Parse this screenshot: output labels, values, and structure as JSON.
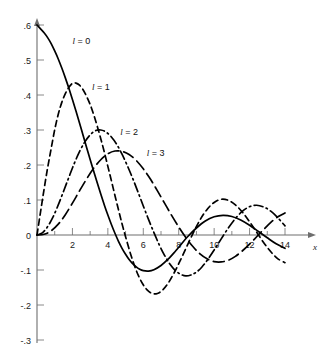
{
  "chart_data": {
    "type": "line",
    "title": "",
    "xlabel": "x",
    "ylabel": "",
    "xlim": [
      0,
      14.8
    ],
    "ylim": [
      -0.3,
      0.65
    ],
    "grid": false,
    "legend": "inline-annotations",
    "x_ticks_major": [
      2,
      4,
      6,
      8,
      10,
      12,
      14
    ],
    "x_ticks_major_labels": [
      "2",
      "4",
      "6",
      "8",
      "10",
      "12",
      "14"
    ],
    "x_ticks_minor": [
      1,
      3,
      5,
      7,
      9,
      11,
      13
    ],
    "y_ticks": [
      0.6,
      0.5,
      0.4,
      0.3,
      0.2,
      0.1,
      0.0,
      -0.1,
      -0.2,
      -0.3
    ],
    "y_tick_labels": [
      ".6",
      ".5",
      ".4",
      ".3",
      ".2",
      ".1",
      "0",
      "-.1",
      "-.2",
      "-.3"
    ],
    "series": [
      {
        "name": "l = 0",
        "label": "l = 0",
        "l": 0,
        "style": "solid",
        "label_x": 2.0,
        "label_y": 0.545,
        "color": "#000000",
        "first_max": 0.6,
        "first_min": -0.2172,
        "first_min_x": 4.49,
        "zeros": [
          3.142,
          6.283,
          9.425,
          12.566
        ],
        "points": [
          [
            0.0,
            0.6
          ],
          [
            0.2,
            0.589
          ],
          [
            0.4,
            0.578
          ],
          [
            0.6,
            0.564
          ],
          [
            0.8,
            0.547
          ],
          [
            1.0,
            0.526
          ],
          [
            1.2,
            0.503
          ],
          [
            1.4,
            0.477
          ],
          [
            1.6,
            0.449
          ],
          [
            1.8,
            0.419
          ],
          [
            2.0,
            0.387
          ],
          [
            2.2,
            0.354
          ],
          [
            2.4,
            0.32
          ],
          [
            2.6,
            0.285
          ],
          [
            2.8,
            0.25
          ],
          [
            3.0,
            0.216
          ],
          [
            3.2,
            0.182
          ],
          [
            3.4,
            0.149
          ],
          [
            3.6,
            0.117
          ],
          [
            3.8,
            0.086
          ],
          [
            4.0,
            0.057
          ],
          [
            4.2,
            0.03
          ],
          [
            4.4,
            0.005
          ],
          [
            4.6,
            -0.018
          ],
          [
            4.8,
            -0.038
          ],
          [
            5.0,
            -0.055
          ],
          [
            5.2,
            -0.07
          ],
          [
            5.4,
            -0.082
          ],
          [
            5.6,
            -0.091
          ],
          [
            5.8,
            -0.098
          ],
          [
            6.0,
            -0.102
          ],
          [
            6.3,
            -0.103
          ],
          [
            6.6,
            -0.099
          ],
          [
            7.0,
            -0.087
          ],
          [
            7.4,
            -0.069
          ],
          [
            7.8,
            -0.047
          ],
          [
            8.0,
            -0.035
          ],
          [
            8.5,
            -0.005
          ],
          [
            9.0,
            0.02
          ],
          [
            9.5,
            0.04
          ],
          [
            10.0,
            0.052
          ],
          [
            10.5,
            0.056
          ],
          [
            11.0,
            0.053
          ],
          [
            11.5,
            0.043
          ],
          [
            12.0,
            0.028
          ],
          [
            12.5,
            0.01
          ],
          [
            13.0,
            -0.008
          ],
          [
            13.5,
            -0.025
          ],
          [
            14.0,
            -0.038
          ]
        ]
      },
      {
        "name": "l = 1",
        "label": "l = 1",
        "l": 1,
        "style": "dashed",
        "label_x": 3.1,
        "label_y": 0.415,
        "color": "#000000",
        "first_max": 0.4345,
        "first_max_x": 2.08,
        "zeros": [
          4.493,
          7.725,
          10.904,
          14.066
        ],
        "points": [
          [
            0.0,
            0.0
          ],
          [
            0.2,
            0.066
          ],
          [
            0.4,
            0.131
          ],
          [
            0.6,
            0.192
          ],
          [
            0.8,
            0.247
          ],
          [
            1.0,
            0.301
          ],
          [
            1.2,
            0.345
          ],
          [
            1.4,
            0.379
          ],
          [
            1.6,
            0.404
          ],
          [
            1.8,
            0.422
          ],
          [
            2.0,
            0.433
          ],
          [
            2.2,
            0.434
          ],
          [
            2.4,
            0.428
          ],
          [
            2.6,
            0.415
          ],
          [
            2.8,
            0.396
          ],
          [
            3.0,
            0.373
          ],
          [
            3.2,
            0.344
          ],
          [
            3.4,
            0.311
          ],
          [
            3.6,
            0.275
          ],
          [
            3.8,
            0.237
          ],
          [
            4.0,
            0.196
          ],
          [
            4.2,
            0.155
          ],
          [
            4.4,
            0.113
          ],
          [
            4.6,
            0.072
          ],
          [
            4.8,
            0.032
          ],
          [
            5.0,
            -0.005
          ],
          [
            5.3,
            -0.057
          ],
          [
            5.6,
            -0.101
          ],
          [
            5.9,
            -0.134
          ],
          [
            6.2,
            -0.156
          ],
          [
            6.5,
            -0.167
          ],
          [
            6.8,
            -0.167
          ],
          [
            7.1,
            -0.157
          ],
          [
            7.4,
            -0.138
          ],
          [
            7.7,
            -0.112
          ],
          [
            8.0,
            -0.082
          ],
          [
            8.4,
            -0.039
          ],
          [
            8.8,
            0.004
          ],
          [
            9.2,
            0.043
          ],
          [
            9.6,
            0.073
          ],
          [
            10.0,
            0.093
          ],
          [
            10.4,
            0.102
          ],
          [
            10.8,
            0.099
          ],
          [
            11.2,
            0.086
          ],
          [
            11.6,
            0.065
          ],
          [
            12.0,
            0.038
          ],
          [
            12.4,
            0.008
          ],
          [
            12.8,
            -0.022
          ],
          [
            13.2,
            -0.048
          ],
          [
            13.6,
            -0.068
          ],
          [
            14.0,
            -0.079
          ]
        ]
      },
      {
        "name": "l = 2",
        "label": "l = 2",
        "l": 2,
        "style": "dashdot",
        "label_x": 4.7,
        "label_y": 0.287,
        "color": "#000000",
        "first_max": 0.3001,
        "first_max_x": 3.34,
        "zeros": [
          5.763,
          9.095,
          12.323
        ],
        "points": [
          [
            0.0,
            0.0
          ],
          [
            0.3,
            0.006
          ],
          [
            0.6,
            0.024
          ],
          [
            0.9,
            0.051
          ],
          [
            1.2,
            0.086
          ],
          [
            1.5,
            0.125
          ],
          [
            1.8,
            0.165
          ],
          [
            2.1,
            0.204
          ],
          [
            2.4,
            0.238
          ],
          [
            2.7,
            0.266
          ],
          [
            3.0,
            0.286
          ],
          [
            3.3,
            0.298
          ],
          [
            3.6,
            0.3
          ],
          [
            3.9,
            0.294
          ],
          [
            4.2,
            0.28
          ],
          [
            4.5,
            0.259
          ],
          [
            4.8,
            0.231
          ],
          [
            5.1,
            0.198
          ],
          [
            5.4,
            0.162
          ],
          [
            5.7,
            0.123
          ],
          [
            6.0,
            0.083
          ],
          [
            6.3,
            0.044
          ],
          [
            6.6,
            0.007
          ],
          [
            6.9,
            -0.028
          ],
          [
            7.2,
            -0.058
          ],
          [
            7.5,
            -0.083
          ],
          [
            7.8,
            -0.101
          ],
          [
            8.1,
            -0.112
          ],
          [
            8.4,
            -0.117
          ],
          [
            8.7,
            -0.114
          ],
          [
            9.0,
            -0.106
          ],
          [
            9.3,
            -0.092
          ],
          [
            9.6,
            -0.073
          ],
          [
            10.0,
            -0.043
          ],
          [
            10.4,
            -0.011
          ],
          [
            10.8,
            0.02
          ],
          [
            11.2,
            0.047
          ],
          [
            11.6,
            0.068
          ],
          [
            12.0,
            0.081
          ],
          [
            12.4,
            0.085
          ],
          [
            12.8,
            0.08
          ],
          [
            13.2,
            0.068
          ],
          [
            13.6,
            0.049
          ],
          [
            14.0,
            0.026
          ]
        ]
      },
      {
        "name": "l = 3",
        "label": "l = 3",
        "l": 3,
        "style": "longdash",
        "label_x": 6.2,
        "label_y": 0.225,
        "color": "#000000",
        "first_max": 0.2404,
        "first_max_x": 4.51,
        "zeros": [
          6.988,
          10.417,
          13.698
        ],
        "points": [
          [
            0.0,
            0.0
          ],
          [
            0.4,
            0.002
          ],
          [
            0.8,
            0.012
          ],
          [
            1.2,
            0.031
          ],
          [
            1.6,
            0.058
          ],
          [
            2.0,
            0.091
          ],
          [
            2.4,
            0.126
          ],
          [
            2.8,
            0.16
          ],
          [
            3.2,
            0.191
          ],
          [
            3.6,
            0.215
          ],
          [
            4.0,
            0.232
          ],
          [
            4.4,
            0.24
          ],
          [
            4.8,
            0.239
          ],
          [
            5.2,
            0.23
          ],
          [
            5.6,
            0.213
          ],
          [
            6.0,
            0.189
          ],
          [
            6.4,
            0.16
          ],
          [
            6.8,
            0.126
          ],
          [
            7.2,
            0.091
          ],
          [
            7.6,
            0.056
          ],
          [
            8.0,
            0.023
          ],
          [
            8.4,
            -0.007
          ],
          [
            8.8,
            -0.033
          ],
          [
            9.2,
            -0.054
          ],
          [
            9.6,
            -0.068
          ],
          [
            10.0,
            -0.076
          ],
          [
            10.4,
            -0.077
          ],
          [
            10.8,
            -0.072
          ],
          [
            11.2,
            -0.061
          ],
          [
            11.6,
            -0.045
          ],
          [
            12.0,
            -0.026
          ],
          [
            12.4,
            -0.005
          ],
          [
            12.8,
            0.016
          ],
          [
            13.2,
            0.036
          ],
          [
            13.6,
            0.052
          ],
          [
            14.0,
            0.063
          ]
        ]
      }
    ]
  },
  "axes": {
    "x_axis_label": "x",
    "origin_label": "0"
  }
}
